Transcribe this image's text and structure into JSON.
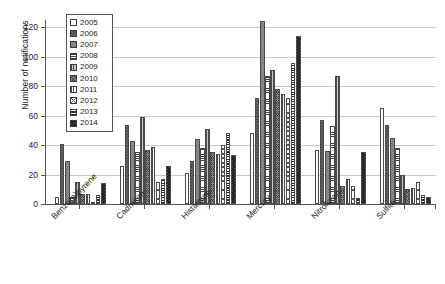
{
  "chart_data": {
    "type": "bar",
    "title": "",
    "xlabel": "",
    "ylabel": "Number of notifications",
    "ylim": [
      0,
      125
    ],
    "yticks": [
      0,
      20,
      40,
      60,
      80,
      100,
      120
    ],
    "ytick_labels": [
      "0",
      "20",
      "40",
      "60",
      "80",
      "100",
      "120"
    ],
    "grid": true,
    "legend_position": "top-left",
    "categories": [
      "Benzo(a)pyrene",
      "Cadmium",
      "Histamine",
      "Mercury",
      "Nitrofuran",
      "Sulfite"
    ],
    "series": [
      {
        "name": "2005",
        "pattern": "blank-white",
        "values": [
          5,
          26,
          21,
          48,
          37,
          65
        ]
      },
      {
        "name": "2006",
        "pattern": "dark-checker",
        "values": [
          41,
          54,
          29,
          72,
          57,
          54
        ]
      },
      {
        "name": "2007",
        "pattern": "grey-checker",
        "values": [
          29,
          43,
          44,
          124,
          36,
          45
        ]
      },
      {
        "name": "2008",
        "pattern": "horizontal-lines",
        "values": [
          5,
          35,
          38,
          87,
          53,
          38
        ]
      },
      {
        "name": "2009",
        "pattern": "vertical-lines-grey",
        "values": [
          15,
          59,
          51,
          91,
          87,
          20
        ]
      },
      {
        "name": "2010",
        "pattern": "diagonal-crosshatch",
        "values": [
          7,
          37,
          35,
          78,
          12,
          10
        ]
      },
      {
        "name": "2011",
        "pattern": "vertical-lines-white",
        "values": [
          7,
          39,
          34,
          75,
          17,
          11
        ]
      },
      {
        "name": "2012",
        "pattern": "sparse-crosshatch",
        "values": [
          1,
          15,
          40,
          72,
          12,
          15
        ]
      },
      {
        "name": "2013",
        "pattern": "thick-horizontal-lines",
        "values": [
          6,
          17,
          48,
          96,
          4,
          6
        ]
      },
      {
        "name": "2014",
        "pattern": "black-checker",
        "values": [
          14,
          26,
          33,
          114,
          35,
          5
        ]
      }
    ]
  },
  "legend": {
    "items": [
      "2005",
      "2006",
      "2007",
      "2008",
      "2009",
      "2010",
      "2011",
      "2012",
      "2013",
      "2014"
    ]
  }
}
